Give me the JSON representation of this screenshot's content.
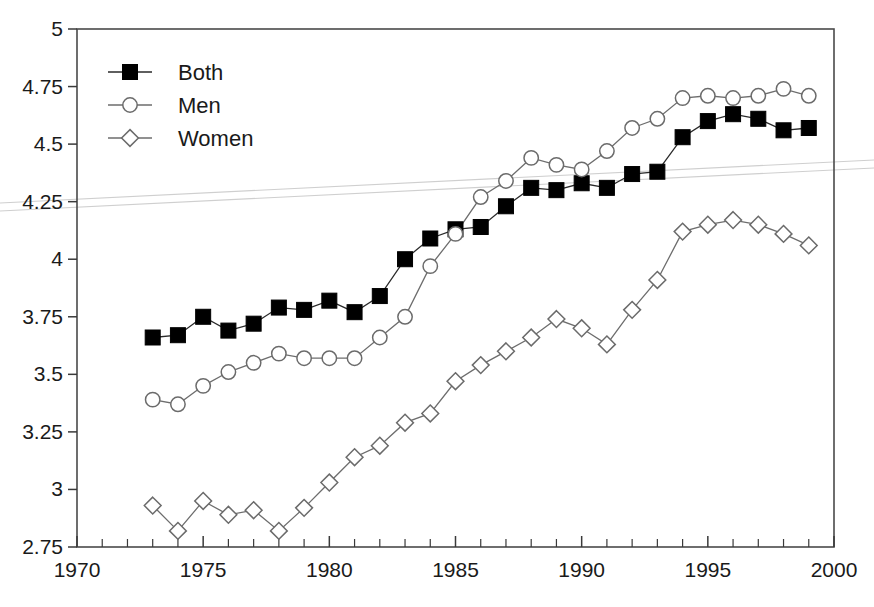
{
  "chart_data": {
    "type": "line",
    "title": "",
    "subtitle": "",
    "xlabel": "",
    "ylabel": "",
    "xlim": [
      1970,
      2000
    ],
    "ylim": [
      2.75,
      5
    ],
    "grid": false,
    "legend_position": "top-left",
    "x_ticks": [
      1970,
      1975,
      1980,
      1985,
      1990,
      1995,
      2000
    ],
    "x_tick_labels": [
      "1970",
      "1975",
      "1980",
      "1985",
      "1990",
      "1995",
      "2000"
    ],
    "x_minor_tick_step": 1,
    "y_ticks": [
      2.75,
      3,
      3.25,
      3.5,
      3.75,
      4,
      4.25,
      4.5,
      4.75,
      5
    ],
    "y_tick_labels": [
      "2.75",
      "3",
      "3.25",
      "3.5",
      "3.75",
      "4",
      "4.25",
      "4.5",
      "4.75",
      "5"
    ],
    "x": [
      1973,
      1974,
      1975,
      1976,
      1977,
      1978,
      1979,
      1980,
      1981,
      1982,
      1983,
      1984,
      1985,
      1986,
      1987,
      1988,
      1989,
      1990,
      1991,
      1992,
      1993,
      1994,
      1995,
      1996,
      1997,
      1998,
      1999
    ],
    "series": [
      {
        "name": "Both",
        "marker": "filled-square",
        "color": "#000000",
        "values": [
          3.66,
          3.67,
          3.75,
          3.69,
          3.72,
          3.79,
          3.78,
          3.82,
          3.77,
          3.84,
          4.0,
          4.09,
          4.13,
          4.14,
          4.23,
          4.31,
          4.3,
          4.33,
          4.31,
          4.37,
          4.38,
          4.53,
          4.6,
          4.63,
          4.61,
          4.56,
          4.57
        ]
      },
      {
        "name": "Men",
        "marker": "open-circle",
        "color": "#6d6d6d",
        "values": [
          3.39,
          3.37,
          3.45,
          3.51,
          3.55,
          3.59,
          3.57,
          3.57,
          3.57,
          3.66,
          3.75,
          3.97,
          4.11,
          4.27,
          4.34,
          4.44,
          4.41,
          4.39,
          4.47,
          4.57,
          4.61,
          4.7,
          4.71,
          4.7,
          4.71,
          4.74,
          4.71
        ]
      },
      {
        "name": "Women",
        "marker": "open-diamond",
        "color": "#6d6d6d",
        "values": [
          2.93,
          2.82,
          2.95,
          2.89,
          2.91,
          2.82,
          2.92,
          3.03,
          3.14,
          3.19,
          3.29,
          3.33,
          3.47,
          3.54,
          3.6,
          3.66,
          3.74,
          3.7,
          3.63,
          3.78,
          3.91,
          4.12,
          4.15,
          4.17,
          4.15,
          4.11,
          4.06
        ]
      }
    ]
  },
  "legend": {
    "items": [
      {
        "label": "Both"
      },
      {
        "label": "Men"
      },
      {
        "label": "Women"
      }
    ]
  }
}
